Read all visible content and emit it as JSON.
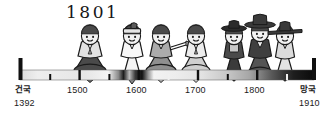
{
  "figure": {
    "title_annotation": "1801",
    "kind": "illustrated-historical-timeline",
    "period_label_left": "건국",
    "period_year_left": "1392",
    "period_label_right": "망국",
    "period_year_right": "1910",
    "axis_ticks": [
      {
        "label": "1500",
        "year": 1500
      },
      {
        "label": "1600",
        "year": 1600
      },
      {
        "label": "1700",
        "year": 1700
      },
      {
        "label": "1800",
        "year": 1800
      }
    ],
    "minor_ticks": [
      1450,
      1550,
      1650,
      1750,
      1850
    ],
    "colors": {
      "ink": "#1a1a1a",
      "bar_light": "#efefef",
      "bar_dark": "#0d0d0d",
      "skin": "#f2f2f2",
      "mid_gray": "#9a9a9a",
      "dark_gray": "#4a4a4a"
    },
    "people": [
      {
        "id": "figure-1",
        "era": "1500",
        "hat": "none",
        "skirt": "dark",
        "top": "light"
      },
      {
        "id": "figure-2",
        "era": "1600",
        "hat": "headband",
        "skirt": "white",
        "top": "white"
      },
      {
        "id": "figure-3",
        "era": "1620",
        "hat": "none",
        "skirt": "mid",
        "top": "mid"
      },
      {
        "id": "figure-4",
        "era": "1700",
        "hat": "none",
        "skirt": "light",
        "top": "light"
      },
      {
        "id": "figure-5",
        "era": "1790",
        "hat": "gat",
        "skirt": "dark",
        "top": "dark"
      },
      {
        "id": "figure-6",
        "era": "1800",
        "hat": "gat-wide",
        "skirt": "dark",
        "top": "dark"
      },
      {
        "id": "figure-7",
        "era": "1830",
        "hat": "gat-brim",
        "skirt": "light",
        "top": "light"
      }
    ]
  }
}
